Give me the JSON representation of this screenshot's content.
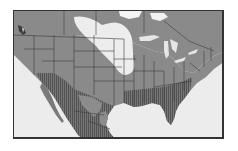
{
  "map": {
    "title": "",
    "region": "North America (United States and Mexico)",
    "colors": {
      "ocean": "#ececec",
      "land_base": "#8a8a8a",
      "light_zone": "#ededed",
      "hatched_zone": "#6e6e6e",
      "hatch_lines": "#4a4a4a",
      "borders": "#3c3c3c",
      "frame": "#333333"
    },
    "legend": []
  }
}
